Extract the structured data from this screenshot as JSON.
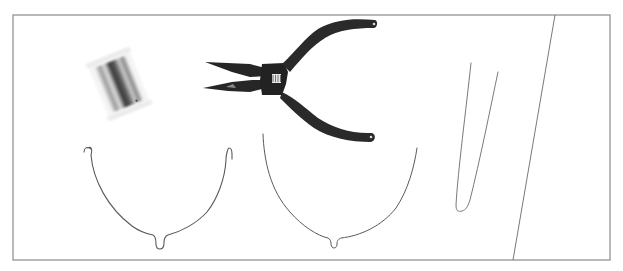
{
  "scene": {
    "description": "Jewelry-making tools laid out inside a rectangular frame",
    "background_color": "#ffffff",
    "frame_color": "#8a8a8a",
    "wire_color": "#5a5a5a",
    "plier_color": "#262626"
  },
  "objects": [
    {
      "id": "wire-spool",
      "label": "Spool of silver wire"
    },
    {
      "id": "pliers",
      "label": "Needle-nose pliers"
    },
    {
      "id": "wire-shape-hooked",
      "label": "Curved wire with hooked ends"
    },
    {
      "id": "wire-shape-open",
      "label": "Curved wire with open ends"
    },
    {
      "id": "wire-shape-v",
      "label": "Narrow V-shaped wire"
    },
    {
      "id": "diagonal-line",
      "label": "Diagonal divider line"
    }
  ]
}
